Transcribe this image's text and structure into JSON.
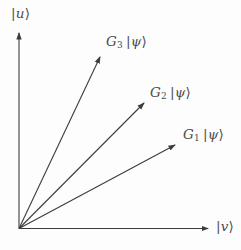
{
  "figure": {
    "background_color": "#fdfdfd",
    "line_color": "#3c3c3c",
    "text_color": "#4c4c4c",
    "origin": {
      "x": 19,
      "y": 228.5
    },
    "axes": {
      "vertical": {
        "tip": {
          "x": 19,
          "y": 33
        },
        "label": {
          "pre": "|",
          "var": "u",
          "post": "⟩"
        }
      },
      "horizontal": {
        "tip": {
          "x": 208,
          "y": 228.5
        },
        "label": {
          "pre": "|",
          "var": "v",
          "post": "⟩"
        }
      }
    },
    "vectors": [
      {
        "id": "g3",
        "tip": {
          "x": 100,
          "y": 57
        },
        "label": {
          "g": "G",
          "sub": "3",
          "pre": "|",
          "var": "ψ",
          "post": "⟩"
        }
      },
      {
        "id": "g2",
        "tip": {
          "x": 144,
          "y": 103
        },
        "label": {
          "g": "G",
          "sub": "2",
          "pre": "|",
          "var": "ψ",
          "post": "⟩"
        }
      },
      {
        "id": "g1",
        "tip": {
          "x": 175,
          "y": 145
        },
        "label": {
          "g": "G",
          "sub": "1",
          "pre": "|",
          "var": "ψ",
          "post": "⟩"
        }
      }
    ]
  }
}
